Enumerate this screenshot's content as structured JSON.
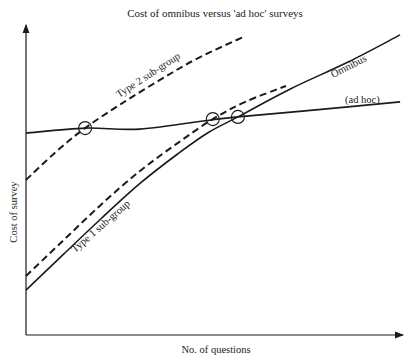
{
  "chart_data": {
    "type": "line",
    "title": "Cost of omnibus versus 'ad hoc' surveys",
    "xlabel": "No. of questions",
    "ylabel": "Cost of survey",
    "xlim": [
      0,
      100
    ],
    "ylim": [
      0,
      100
    ],
    "units_note": "Conceptual diagram with no numeric ticks; values are normalized positions (0-100) along each axis.",
    "grid": false,
    "legend": "none (curves labelled inline)",
    "series": [
      {
        "name": "(ad hoc)",
        "style": "solid",
        "label_text": "(ad hoc)",
        "points": [
          [
            0,
            64.7
          ],
          [
            15.6,
            66.3
          ],
          [
            30,
            66.0
          ],
          [
            49.3,
            69.0
          ],
          [
            55.9,
            69.9
          ],
          [
            75,
            72.0
          ],
          [
            98.7,
            74.7
          ]
        ]
      },
      {
        "name": "Omnibus",
        "style": "solid",
        "label_text": "Omnibus",
        "points": [
          [
            0,
            14.4
          ],
          [
            10,
            26.0
          ],
          [
            20,
            37.5
          ],
          [
            30,
            48.5
          ],
          [
            40,
            58.0
          ],
          [
            48,
            64.8
          ],
          [
            55.9,
            69.9
          ],
          [
            70,
            79.0
          ],
          [
            85,
            87.5
          ],
          [
            98.7,
            96.2
          ]
        ]
      },
      {
        "name": "Type 1 sub-group",
        "style": "dashed",
        "label_text": "Type 1 sub-group",
        "points": [
          [
            0,
            18.9
          ],
          [
            10,
            30.5
          ],
          [
            20,
            42.0
          ],
          [
            30,
            52.5
          ],
          [
            40,
            61.5
          ],
          [
            49.3,
            69.2
          ],
          [
            58,
            74.8
          ],
          [
            68.6,
            79.8
          ]
        ]
      },
      {
        "name": "Type 2 sub-group",
        "style": "dashed",
        "label_text": "Type 2 sub-group",
        "points": [
          [
            0,
            49.7
          ],
          [
            8,
            58.8
          ],
          [
            15.6,
            66.3
          ],
          [
            25,
            74.0
          ],
          [
            35,
            81.5
          ],
          [
            45,
            88.5
          ],
          [
            57.8,
            95.8
          ]
        ]
      }
    ],
    "annotations": [
      {
        "type": "circle",
        "note": "Type 2 sub-group crosses ad hoc",
        "at": [
          15.6,
          66.3
        ]
      },
      {
        "type": "circle",
        "note": "Type 1 sub-group crosses ad hoc",
        "at": [
          49.3,
          69.2
        ]
      },
      {
        "type": "circle",
        "note": "Omnibus crosses ad hoc",
        "at": [
          55.9,
          69.9
        ]
      }
    ]
  }
}
